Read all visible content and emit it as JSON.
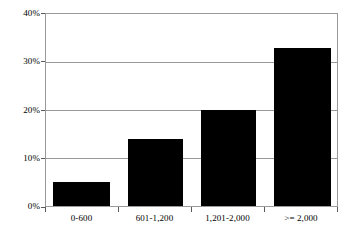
{
  "chart_data": {
    "type": "bar",
    "title": "",
    "subtitle": "",
    "xlabel": "",
    "ylabel": "",
    "categories": [
      "0-600",
      "601-1,200",
      "1,201-2,000",
      ">= 2,000"
    ],
    "values": [
      5,
      14,
      20,
      33
    ],
    "value_labels": [
      "5%",
      "14%",
      "20%",
      "33%"
    ],
    "series": [
      {
        "name": "",
        "values": [
          5,
          14,
          20,
          33
        ]
      }
    ],
    "ylim": [
      0,
      40
    ],
    "ytick_values": [
      0,
      10,
      20,
      30,
      40
    ],
    "ytick_labels": [
      "0%",
      "10%",
      "20%",
      "30%",
      "40%"
    ],
    "grid": true,
    "grid_axis": "y",
    "legend": false,
    "legend_position": "none",
    "bar_color": "#000000",
    "grid_color": "#9a9a9a",
    "axis_color": "#9a9a9a",
    "background_color": "#ffffff",
    "annotations": []
  }
}
